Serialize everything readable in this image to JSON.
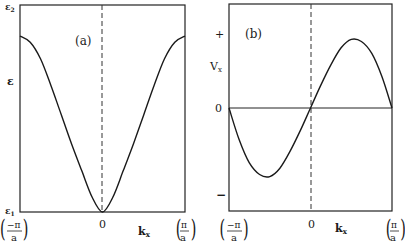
{
  "chart_data": [
    {
      "type": "line",
      "panel_label": "(a)",
      "title": "",
      "xlabel": "k_x",
      "ylabel": "ε",
      "x_ticks": [
        "(−π/a)",
        "0",
        "(π/a)"
      ],
      "y_ticks": [
        "ε₁",
        "ε",
        "ε₂"
      ],
      "xlim": [
        -3.1416,
        3.1416
      ],
      "ylim": [
        "ε₁",
        "ε₂"
      ],
      "grid": false,
      "annotations": [
        "dashed vertical line at k_x = 0"
      ],
      "series": [
        {
          "name": "ε(k_x)",
          "x": [
            -3.14,
            -2.75,
            -2.36,
            -1.96,
            -1.57,
            -1.18,
            -0.79,
            -0.39,
            0,
            0.39,
            0.79,
            1.18,
            1.57,
            1.96,
            2.36,
            2.75,
            3.14
          ],
          "values": [
            0.85,
            0.82,
            0.74,
            0.61,
            0.47,
            0.33,
            0.2,
            0.07,
            0.0,
            0.07,
            0.2,
            0.33,
            0.47,
            0.61,
            0.74,
            0.82,
            0.85
          ]
        }
      ]
    },
    {
      "type": "line",
      "panel_label": "(b)",
      "title": "",
      "xlabel": "k_x",
      "ylabel": "V_x",
      "x_ticks": [
        "(−π/a)",
        "0",
        "(π/a)"
      ],
      "y_ticks": [
        "−",
        "0",
        "+"
      ],
      "xlim": [
        -3.1416,
        3.1416
      ],
      "ylim": [
        -1,
        1
      ],
      "grid": false,
      "annotations": [
        "dashed vertical line at k_x = 0",
        "horizontal line at V_x = 0"
      ],
      "series": [
        {
          "name": "V_x(k_x)",
          "x": [
            -3.14,
            -2.75,
            -2.36,
            -1.96,
            -1.57,
            -1.18,
            -0.79,
            -0.39,
            0,
            0.39,
            0.79,
            1.18,
            1.57,
            1.96,
            2.36,
            2.75,
            3.14
          ],
          "values": [
            0,
            -0.45,
            -0.78,
            -0.95,
            -0.98,
            -0.86,
            -0.62,
            -0.32,
            0,
            0.32,
            0.62,
            0.86,
            0.98,
            0.95,
            0.78,
            0.45,
            0
          ]
        }
      ]
    }
  ],
  "labels": {
    "panel_a": "(a)",
    "panel_b": "(b)",
    "eps2": "ε",
    "eps2_sub": "2",
    "eps": "ε",
    "eps1": "ε",
    "eps1_sub": "1",
    "vx": "V",
    "vx_sub": "x",
    "plus": "+",
    "minus": "−",
    "zero": "0",
    "kx": "k",
    "kx_sub": "x",
    "neg_pi": "−π",
    "pi": "π",
    "a": "a"
  }
}
